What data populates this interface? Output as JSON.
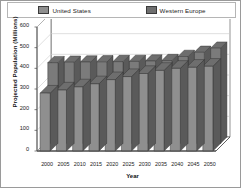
{
  "chart_data": {
    "type": "bar",
    "title": "",
    "xlabel": "Year",
    "ylabel": "Projected Population (Millions)",
    "categories": [
      "2000",
      "2005",
      "2010",
      "2015",
      "2020",
      "2025",
      "2030",
      "2035",
      "2040",
      "2045",
      "2050"
    ],
    "series": [
      {
        "name": "United States",
        "color": "#8a8a8a",
        "values": [
          280,
          295,
          310,
          325,
          345,
          360,
          375,
          390,
          400,
          405,
          410
        ]
      },
      {
        "name": "Western Europe",
        "color": "#787878",
        "values": [
          390,
          392,
          393,
          394,
          395,
          396,
          398,
          400,
          420,
          440,
          460
        ]
      }
    ],
    "ylim": [
      0,
      600
    ],
    "yticks": [
      0,
      100,
      200,
      300,
      400,
      500,
      600
    ],
    "ytick_labels": [
      "0",
      "100",
      "200",
      "300",
      "400",
      "500",
      "600"
    ],
    "grid": true,
    "legend_position": "top",
    "projection": "3d"
  },
  "legend": {
    "entries": [
      {
        "label": "United States"
      },
      {
        "label": "Western Europe"
      }
    ]
  },
  "colors": {
    "bar_front_us": "#8f8f8f",
    "bar_front_we": "#7b7b7b",
    "bar_top": "#6e6e6e",
    "bar_side": "#5a5a5a",
    "bar_outline": "#2f2f2f",
    "grid": "#c9c9c9",
    "axis": "#4a4a4a",
    "wall": "#ffffff",
    "floor": "#ffffff",
    "frame": "#9a9a9a",
    "text": "#1a1a1a"
  }
}
